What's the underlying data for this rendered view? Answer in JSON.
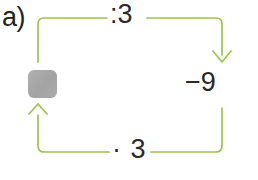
{
  "exercise": {
    "item_label": "a)",
    "unknown_placeholder": "blank-box"
  },
  "diagram": {
    "type": "arrow-chain-loop",
    "stroke_color": "#9ec34b",
    "text_color": "#2a2a2a",
    "placeholder_color": "#a9a9a9",
    "operations": {
      "top": ":3",
      "right": "−9",
      "bottom": "· 3"
    },
    "arrows": {
      "right_arrow_direction": "down",
      "left_arrow_direction": "up"
    }
  }
}
